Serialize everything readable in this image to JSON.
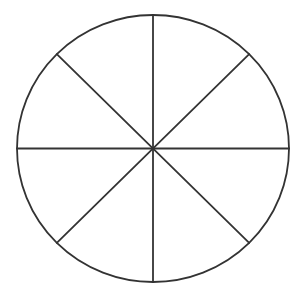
{
  "figure": {
    "description": "Circle divided into 8 equal sectors by four diameters",
    "type": "divided-circle",
    "sector_count": 8,
    "background_color": "#ffffff",
    "stroke_color": "#333333",
    "stroke_width": 1.8,
    "center": {
      "x": 153,
      "y": 148.5
    },
    "radius": {
      "x": 136,
      "y": 133.5
    },
    "spoke_angles_deg": [
      0,
      45,
      90,
      135
    ]
  }
}
